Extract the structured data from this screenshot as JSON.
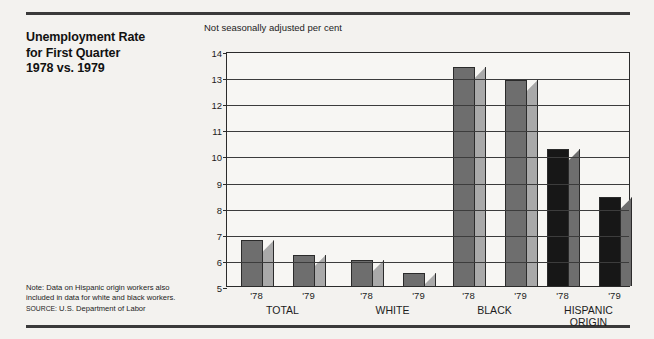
{
  "title": {
    "lines": [
      "Unemployment Rate",
      "for First Quarter",
      "1978 vs. 1979"
    ]
  },
  "note": {
    "line1": "Note: Data on Hispanic origin workers also",
    "line2": "included in data for white and black workers.",
    "source_prefix": "SOURCE:",
    "source_text": "U.S. Department of Labor"
  },
  "colors": {
    "background": "#f3f2ef",
    "rule": "#3a3a3a",
    "axis": "#2b2b2b",
    "bar_front_mid": "#6e6e6e",
    "bar_side_mid": "#a9a9a9",
    "bar_front_dark": "#171717",
    "bar_side_dark": "#6e6e6e"
  },
  "chart_data": {
    "type": "bar",
    "title": "Unemployment Rate for First Quarter 1978 vs. 1979",
    "subtitle": "Not seasonally adjusted per cent",
    "xlabel": "",
    "ylabel": "",
    "ylim": [
      5,
      14
    ],
    "yticks": [
      5,
      6,
      7,
      8,
      9,
      10,
      11,
      12,
      13,
      14
    ],
    "ytick_labels": [
      "5",
      "6",
      "7",
      "8",
      "9",
      "10",
      "11",
      "12",
      "13",
      "14"
    ],
    "grid": true,
    "legend": "none",
    "categories": [
      "TOTAL",
      "WHITE",
      "BLACK",
      "HISPANIC ORIGIN"
    ],
    "series": [
      {
        "name": "'78",
        "values": [
          6.75,
          6.0,
          13.4,
          10.25
        ]
      },
      {
        "name": "'79",
        "values": [
          6.2,
          5.5,
          12.9,
          8.4
        ]
      }
    ],
    "bars": [
      {
        "group": "TOTAL",
        "group_lines": [
          "TOTAL"
        ],
        "year": "'78",
        "value": 6.75,
        "shade": "mid"
      },
      {
        "group": "TOTAL",
        "group_lines": [
          "TOTAL"
        ],
        "year": "'79",
        "value": 6.2,
        "shade": "mid"
      },
      {
        "group": "WHITE",
        "group_lines": [
          "WHITE"
        ],
        "year": "'78",
        "value": 6.0,
        "shade": "mid"
      },
      {
        "group": "WHITE",
        "group_lines": [
          "WHITE"
        ],
        "year": "'79",
        "value": 5.5,
        "shade": "mid"
      },
      {
        "group": "BLACK",
        "group_lines": [
          "BLACK"
        ],
        "year": "'78",
        "value": 13.4,
        "shade": "mid"
      },
      {
        "group": "BLACK",
        "group_lines": [
          "BLACK"
        ],
        "year": "'79",
        "value": 12.9,
        "shade": "mid"
      },
      {
        "group": "HISPANIC ORIGIN",
        "group_lines": [
          "HISPANIC",
          "ORIGIN"
        ],
        "year": "'78",
        "value": 10.25,
        "shade": "dark"
      },
      {
        "group": "HISPANIC ORIGIN",
        "group_lines": [
          "HISPANIC",
          "ORIGIN"
        ],
        "year": "'79",
        "value": 8.4,
        "shade": "dark"
      }
    ]
  }
}
